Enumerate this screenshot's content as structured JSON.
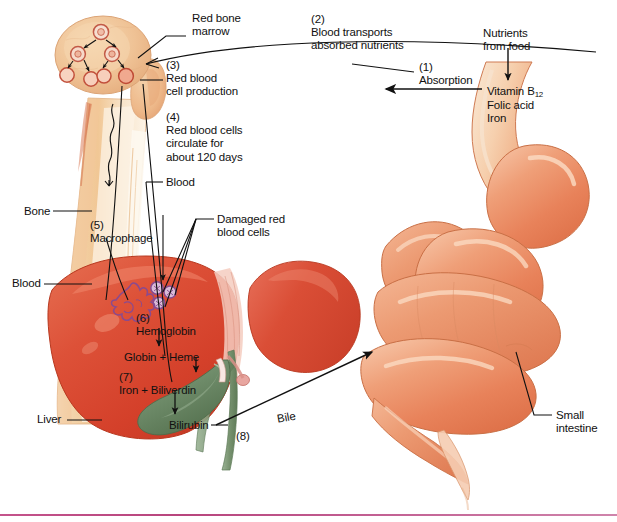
{
  "figure": {
    "type": "biological-diagram",
    "width": 617,
    "height": 522,
    "background": "#ffffff"
  },
  "colors": {
    "liver_red": "#d8452f",
    "liver_red_light": "#e8634a",
    "intestine_orange": "#e8835c",
    "intestine_light": "#f2ad8c",
    "bone_tan": "#f0c89a",
    "bone_pale": "#faeedd",
    "marrow_tan": "#eec193",
    "gallbladder_green": "#6f8c6a",
    "macrophage_purple": "#8a4a8f",
    "rbc_purple": "#7a3f86",
    "leader_line": "#111111",
    "text": "#111111",
    "bottom_rule": "#b8457d"
  },
  "labels": [
    {
      "id": "red-bone-marrow",
      "lines": [
        "Red bone",
        "marrow"
      ],
      "x": 192,
      "y": 12
    },
    {
      "id": "blood-transports",
      "lines": [
        "(2)",
        "Blood transports",
        "absorbed nutrients"
      ],
      "x": 311,
      "y": 13
    },
    {
      "id": "nutrients-from-food",
      "lines": [
        "Nutrients",
        "from food"
      ],
      "x": 483,
      "y": 27
    },
    {
      "id": "rbc-production",
      "lines": [
        "(3)",
        "Red blood",
        "cell production"
      ],
      "x": 166,
      "y": 59
    },
    {
      "id": "absorption",
      "lines": [
        "(1)",
        "Absorption"
      ],
      "x": 419,
      "y": 61
    },
    {
      "id": "nutrient-list",
      "lines": [
        "Vitamin B12",
        "Folic acid",
        "Iron"
      ],
      "x": 487,
      "y": 85
    },
    {
      "id": "rbc-circulate",
      "lines": [
        "(4)",
        "Red blood cells",
        "circulate for",
        "about 120 days"
      ],
      "x": 166,
      "y": 111
    },
    {
      "id": "blood-upper",
      "lines": [
        "Blood"
      ],
      "x": 166,
      "y": 177
    },
    {
      "id": "bone",
      "lines": [
        "Bone"
      ],
      "x": 24,
      "y": 205
    },
    {
      "id": "damaged-rbc",
      "lines": [
        "Damaged red",
        "blood cells"
      ],
      "x": 217,
      "y": 213
    },
    {
      "id": "macrophage",
      "lines": [
        "(5)",
        "Macrophage"
      ],
      "x": 90,
      "y": 219
    },
    {
      "id": "blood-lower",
      "lines": [
        "Blood"
      ],
      "x": 12,
      "y": 278
    },
    {
      "id": "hemoglobin",
      "lines": [
        "(6)",
        "Hemoglobin"
      ],
      "x": 136,
      "y": 313
    },
    {
      "id": "globin-heme",
      "lines": [
        "Globin + Heme"
      ],
      "x": 124,
      "y": 351
    },
    {
      "id": "iron-biliverdin",
      "lines": [
        "(7)",
        "Iron + Biliverdin"
      ],
      "x": 119,
      "y": 372
    },
    {
      "id": "liver",
      "lines": [
        "Liver"
      ],
      "x": 37,
      "y": 414
    },
    {
      "id": "bilirubin",
      "lines": [
        "Bilirubin"
      ],
      "x": 169,
      "y": 420
    },
    {
      "id": "bile",
      "lines": [
        "Bile"
      ],
      "x": 276,
      "y": 416
    },
    {
      "id": "step-eight",
      "lines": [
        "(8)"
      ],
      "x": 236,
      "y": 430
    },
    {
      "id": "small-intestine",
      "lines": [
        "Small",
        "intestine"
      ],
      "x": 556,
      "y": 409
    }
  ],
  "steps": [
    {
      "number": "(1)",
      "text": "Absorption"
    },
    {
      "number": "(2)",
      "text": "Blood transports absorbed nutrients"
    },
    {
      "number": "(3)",
      "text": "Red blood cell production"
    },
    {
      "number": "(4)",
      "text": "Red blood cells circulate for about 120 days"
    },
    {
      "number": "(5)",
      "text": "Macrophage"
    },
    {
      "number": "(6)",
      "text": "Hemoglobin"
    },
    {
      "number": "(7)",
      "text": "Iron + Biliverdin"
    },
    {
      "number": "(8)",
      "text": "Bile"
    }
  ],
  "anatomy": [
    {
      "name": "Red bone marrow"
    },
    {
      "name": "Bone"
    },
    {
      "name": "Blood"
    },
    {
      "name": "Liver"
    },
    {
      "name": "Small intestine"
    },
    {
      "name": "Damaged red blood cells"
    }
  ],
  "chemistry": {
    "nutrients": [
      "Vitamin B12",
      "Folic acid",
      "Iron"
    ],
    "breakdown_chain": [
      "Hemoglobin",
      "Globin + Heme",
      "Iron + Biliverdin",
      "Bilirubin"
    ]
  }
}
